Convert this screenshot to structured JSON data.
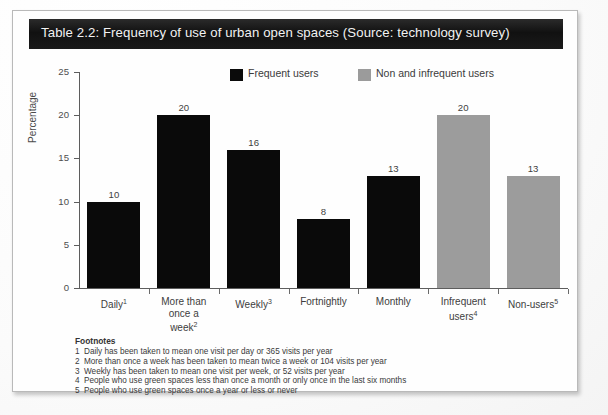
{
  "title": "Table 2.2: Frequency of use of urban open spaces (Source: technology survey)",
  "legend": [
    {
      "label": "Frequent users",
      "color": "#0a0a0a",
      "key": "frequent"
    },
    {
      "label": "Non and infrequent users",
      "color": "#9c9c9c",
      "key": "infrequent"
    }
  ],
  "footnotes": {
    "heading": "Footnotes",
    "items": [
      {
        "num": "1",
        "text": "Daily has been taken to mean one visit per day or 365 visits per year"
      },
      {
        "num": "2",
        "text": "More than once a week has been taken to mean twice a week or 104 visits per year"
      },
      {
        "num": "3",
        "text": "Weekly has been taken to mean one visit per week, or 52 visits per year"
      },
      {
        "num": "4",
        "text": "People who use green spaces less than once a month or only once in the last six months"
      },
      {
        "num": "5",
        "text": "People who use green spaces once a year or less or never"
      }
    ]
  },
  "chart_data": {
    "type": "bar",
    "title": "Table 2.2: Frequency of use of urban open spaces (Source: technology survey)",
    "xlabel": "",
    "ylabel": "Percentage",
    "ylim": [
      0,
      25
    ],
    "yticks": [
      0,
      5,
      10,
      15,
      20,
      25
    ],
    "grid": false,
    "legend_position": "top",
    "categories": [
      "Daily¹",
      "More than once a week²",
      "Weekly³",
      "Fortnightly",
      "Monthly",
      "Infrequent users⁴",
      "Non-users⁵"
    ],
    "category_lines": [
      [
        "Daily",
        "1"
      ],
      [
        "More than",
        "once a",
        "week",
        "2"
      ],
      [
        "Weekly",
        "3"
      ],
      [
        "Fortnightly",
        ""
      ],
      [
        "Monthly",
        ""
      ],
      [
        "Infrequent",
        "users",
        "4"
      ],
      [
        "Non-users",
        "5"
      ]
    ],
    "values": [
      10,
      20,
      16,
      8,
      13,
      20,
      13
    ],
    "value_labels": [
      "10",
      "20",
      "16",
      "8",
      "13",
      "20",
      "13"
    ],
    "bar_colors": [
      "#0a0a0a",
      "#0a0a0a",
      "#0a0a0a",
      "#0a0a0a",
      "#0a0a0a",
      "#9c9c9c",
      "#9c9c9c"
    ],
    "series": [
      {
        "name": "Frequent users",
        "values": [
          10,
          20,
          16,
          8,
          13,
          null,
          null
        ]
      },
      {
        "name": "Non and infrequent users",
        "values": [
          null,
          null,
          null,
          null,
          null,
          20,
          13
        ]
      }
    ]
  }
}
